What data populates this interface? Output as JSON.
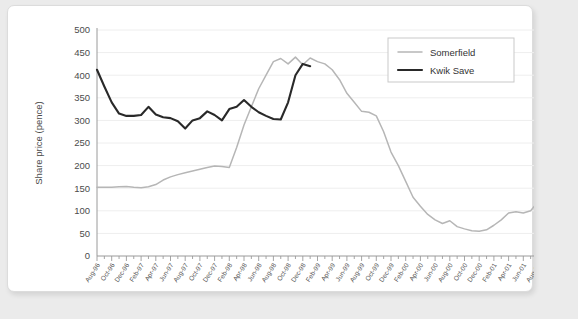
{
  "chart_data": {
    "type": "line",
    "title": "",
    "xlabel": "",
    "ylabel": "Share price (pence)",
    "ylim": [
      0,
      500
    ],
    "ytick_step": 50,
    "yticks": [
      "0",
      "50",
      "100",
      "150",
      "200",
      "250",
      "300",
      "350",
      "400",
      "450",
      "500"
    ],
    "grid": true,
    "legend_position": "top-right",
    "x_tick_labels": [
      "Aug-96",
      "Oct-96",
      "Dec-96",
      "Feb-97",
      "Apr-97",
      "Jun-97",
      "Aug-97",
      "Oct-97",
      "Dec-97",
      "Feb-98",
      "Apr-98",
      "Jun-98",
      "Aug-98",
      "Oct-98",
      "Dec-98",
      "Feb-99",
      "Apr-99",
      "Jun-99",
      "Aug-99",
      "Oct-99",
      "Dec-99",
      "Feb-00",
      "Apr-00",
      "Jun-00",
      "Aug-00",
      "Oct-00",
      "Dec-00",
      "Feb-01",
      "Apr-01",
      "Jun-01",
      "Aug-01"
    ],
    "x_months": [
      "Aug-96",
      "Sep-96",
      "Oct-96",
      "Nov-96",
      "Dec-96",
      "Jan-97",
      "Feb-97",
      "Mar-97",
      "Apr-97",
      "May-97",
      "Jun-97",
      "Jul-97",
      "Aug-97",
      "Sep-97",
      "Oct-97",
      "Nov-97",
      "Dec-97",
      "Jan-98",
      "Feb-98",
      "Mar-98",
      "Apr-98",
      "May-98",
      "Jun-98",
      "Jul-98",
      "Aug-98",
      "Sep-98",
      "Oct-98",
      "Nov-98",
      "Dec-98",
      "Jan-99",
      "Feb-99",
      "Mar-99",
      "Apr-99",
      "May-99",
      "Jun-99",
      "Jul-99",
      "Aug-99",
      "Sep-99",
      "Oct-99",
      "Nov-99",
      "Dec-99",
      "Jan-00",
      "Feb-00",
      "Mar-00",
      "Apr-00",
      "May-00",
      "Jun-00",
      "Jul-00",
      "Aug-00",
      "Sep-00",
      "Oct-00",
      "Nov-00",
      "Dec-00",
      "Jan-01",
      "Feb-01",
      "Mar-01",
      "Apr-01",
      "May-01",
      "Jun-01",
      "Jul-01",
      "Aug-01"
    ],
    "series": [
      {
        "name": "Somerfield",
        "color": "#b6b6b6",
        "values": [
          152,
          152,
          152,
          153,
          154,
          152,
          151,
          153,
          158,
          168,
          175,
          180,
          184,
          188,
          192,
          196,
          199,
          198,
          196,
          240,
          290,
          330,
          370,
          400,
          430,
          437,
          425,
          440,
          423,
          438,
          430,
          425,
          412,
          390,
          360,
          340,
          320,
          318,
          310,
          275,
          230,
          200,
          165,
          130,
          110,
          92,
          80,
          72,
          78,
          65,
          60,
          56,
          55,
          58,
          68,
          80,
          95,
          98,
          95,
          100,
          120,
          138,
          130,
          125
        ]
      },
      {
        "name": "Kwik Save",
        "color": "#292929",
        "values": [
          412,
          375,
          340,
          315,
          310,
          310,
          312,
          330,
          313,
          307,
          305,
          298,
          282,
          300,
          305,
          320,
          312,
          300,
          325,
          330,
          345,
          330,
          318,
          310,
          303,
          302,
          340,
          400,
          425,
          420
        ]
      }
    ]
  },
  "legend": {
    "items": [
      {
        "label": "Somerfield",
        "color": "#b6b6b6"
      },
      {
        "label": "Kwik Save",
        "color": "#292929"
      }
    ]
  },
  "axis": {
    "y_title": "Share price (pence)"
  }
}
